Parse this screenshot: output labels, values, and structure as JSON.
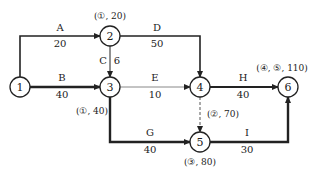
{
  "diagram": {
    "type": "activity-on-arrow network",
    "nodes": [
      {
        "id": "1",
        "label": "1",
        "x": 20,
        "y": 87
      },
      {
        "id": "2",
        "label": "2",
        "x": 110,
        "y": 36,
        "annotation": "(①, 20)"
      },
      {
        "id": "3",
        "label": "3",
        "x": 110,
        "y": 87,
        "annotation": "(①, 40)"
      },
      {
        "id": "4",
        "label": "4",
        "x": 200,
        "y": 87,
        "annotation": "(②, 70)"
      },
      {
        "id": "5",
        "label": "5",
        "x": 200,
        "y": 142,
        "annotation": "(③, 80)"
      },
      {
        "id": "6",
        "label": "6",
        "x": 288,
        "y": 87,
        "annotation": "(④, ⑤, 110)"
      }
    ],
    "activities": [
      {
        "name": "A",
        "duration": "20",
        "from": "1",
        "to": "2"
      },
      {
        "name": "B",
        "duration": "40",
        "from": "1",
        "to": "3"
      },
      {
        "name": "C",
        "duration": "6",
        "from": "2",
        "to": "3"
      },
      {
        "name": "D",
        "duration": "50",
        "from": "2",
        "to": "4"
      },
      {
        "name": "E",
        "duration": "10",
        "from": "3",
        "to": "4"
      },
      {
        "name": "G",
        "duration": "40",
        "from": "3",
        "to": "5"
      },
      {
        "name": "H",
        "duration": "40",
        "from": "4",
        "to": "6"
      },
      {
        "name": "I",
        "duration": "30",
        "from": "5",
        "to": "6"
      },
      {
        "name": "",
        "duration": "",
        "from": "4",
        "to": "5",
        "dummy": true
      }
    ],
    "colors": {
      "line": "#222222",
      "light_line": "#888888",
      "background": "#ffffff"
    }
  }
}
